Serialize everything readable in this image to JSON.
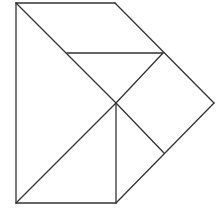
{
  "diagram": {
    "type": "tangram",
    "stroke": "#333333",
    "background": "#ffffff",
    "stroke_width": 1.3,
    "outline": [
      [
        16,
        3
      ],
      [
        115,
        3
      ],
      [
        214,
        103
      ],
      [
        116,
        203
      ],
      [
        16,
        203
      ]
    ],
    "segments": [
      {
        "name": "outline-top",
        "from": [
          16,
          3
        ],
        "to": [
          115,
          3
        ]
      },
      {
        "name": "outline-right-upper",
        "from": [
          115,
          3
        ],
        "to": [
          214,
          103
        ]
      },
      {
        "name": "outline-right-lower",
        "from": [
          214,
          103
        ],
        "to": [
          116,
          203
        ]
      },
      {
        "name": "outline-bottom",
        "from": [
          116,
          203
        ],
        "to": [
          16,
          203
        ]
      },
      {
        "name": "outline-left",
        "from": [
          16,
          203
        ],
        "to": [
          16,
          3
        ]
      },
      {
        "name": "diagonal-main",
        "from": [
          16,
          3
        ],
        "to": [
          116,
          103
        ]
      },
      {
        "name": "horizontal-mid",
        "from": [
          67,
          53
        ],
        "to": [
          163,
          53
        ]
      },
      {
        "name": "diagonal-center-up",
        "from": [
          116,
          103
        ],
        "to": [
          163,
          53
        ]
      },
      {
        "name": "diagonal-center-down",
        "from": [
          116,
          103
        ],
        "to": [
          164,
          153
        ]
      },
      {
        "name": "vertical-center",
        "from": [
          116,
          103
        ],
        "to": [
          116,
          203
        ]
      },
      {
        "name": "diagonal-lower-left",
        "from": [
          16,
          203
        ],
        "to": [
          116,
          103
        ]
      }
    ]
  }
}
